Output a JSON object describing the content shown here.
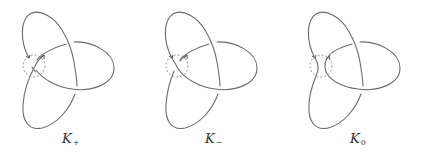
{
  "figure": {
    "stroke_color": "#6b6b6b",
    "circle_color": "#8a8a8a",
    "panels": [
      {
        "id": "k-plus",
        "label_main": "K",
        "label_sub": "+",
        "crossing_type": "positive"
      },
      {
        "id": "k-minus",
        "label_main": "K",
        "label_sub": "−",
        "crossing_type": "negative"
      },
      {
        "id": "k-zero",
        "label_main": "K",
        "label_sub": "0",
        "crossing_type": "smoothing"
      }
    ]
  }
}
